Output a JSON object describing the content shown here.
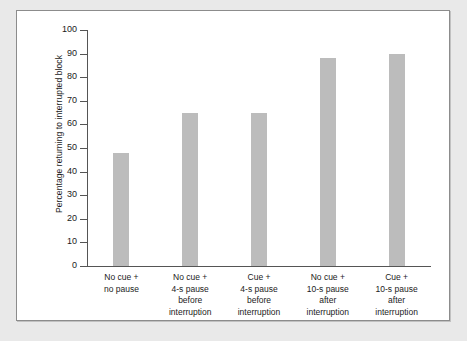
{
  "chart_data": {
    "type": "bar",
    "title": "",
    "xlabel": "",
    "ylabel": "Percentage returning to interrupted block",
    "ylim": [
      0,
      100
    ],
    "ytick_step": 10,
    "yticks": [
      100,
      90,
      80,
      70,
      60,
      50,
      40,
      30,
      20,
      10,
      0
    ],
    "grid": false,
    "legend": null,
    "bar_color": "#bcbcbc",
    "axis_color": "#555555",
    "frame_border_color": "#8c8c8c",
    "page_background": "#e9e9e9",
    "plot_background": "#ffffff",
    "categories": [
      "No cue +\nno pause",
      "No cue +\n4-s pause\nbefore\ninterruption",
      "Cue +\n4-s pause\nbefore\ninterruption",
      "No cue +\n10-s pause\nafter\ninterruption",
      "Cue +\n10-s pause\nafter\ninterruption"
    ],
    "category_lines": [
      [
        "No cue +",
        "no pause"
      ],
      [
        "No cue +",
        "4-s pause",
        "before",
        "interruption"
      ],
      [
        "Cue +",
        "4-s pause",
        "before",
        "interruption"
      ],
      [
        "No cue +",
        "10-s pause",
        "after",
        "interruption"
      ],
      [
        "Cue +",
        "10-s pause",
        "after",
        "interruption"
      ]
    ],
    "values": [
      48,
      65,
      65,
      88,
      90
    ]
  }
}
